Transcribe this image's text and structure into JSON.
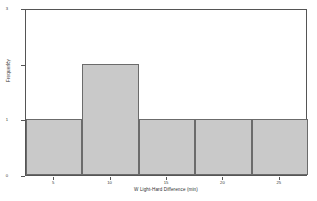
{
  "chart_data": {
    "type": "bar",
    "title": "",
    "subtitle": "",
    "xlabel": "W Light-Hard Difference (min)",
    "ylabel": "Frequency",
    "xlim": [
      2.5,
      27.5
    ],
    "ylim": [
      0,
      3
    ],
    "grid": false,
    "legend": null,
    "bin_width": 5,
    "bin_edges": [
      2.5,
      7.5,
      12.5,
      17.5,
      22.5,
      27.5
    ],
    "categories": [
      "2.5-7.5",
      "7.5-12.5",
      "12.5-17.5",
      "17.5-22.5",
      "22.5-27.5"
    ],
    "values": [
      1,
      2,
      1,
      1,
      1
    ],
    "bar_color": "#c9c9c9",
    "bar_edge_color": "#6b6b6b",
    "x_ticks": [
      {
        "value": 5,
        "label": "5"
      },
      {
        "value": 10,
        "label": "10"
      },
      {
        "value": 15,
        "label": "15"
      },
      {
        "value": 20,
        "label": "20"
      },
      {
        "value": 25,
        "label": "25"
      }
    ],
    "y_ticks": [
      {
        "value": 0,
        "label": "0"
      },
      {
        "value": 1,
        "label": "1"
      },
      {
        "value": 2,
        "label": "2"
      },
      {
        "value": 3,
        "label": "3"
      }
    ]
  }
}
